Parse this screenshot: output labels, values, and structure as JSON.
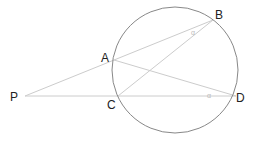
{
  "diagram": {
    "type": "geometry",
    "circle": {
      "cx": 175,
      "cy": 70,
      "r": 63,
      "stroke": "#888888"
    },
    "points": {
      "P": {
        "label": "P",
        "x": 25,
        "y": 96
      },
      "A": {
        "label": "A",
        "x": 114,
        "y": 60
      },
      "B": {
        "label": "B",
        "x": 213,
        "y": 20
      },
      "C": {
        "label": "C",
        "x": 118,
        "y": 96
      },
      "D": {
        "label": "D",
        "x": 236,
        "y": 96
      }
    },
    "segments": [
      {
        "from": "P",
        "to": "B"
      },
      {
        "from": "P",
        "to": "D"
      },
      {
        "from": "A",
        "to": "D"
      },
      {
        "from": "C",
        "to": "B"
      }
    ],
    "line_color": "#cccccc",
    "angle_marks": [
      {
        "label": "α",
        "at": "B",
        "x": 194,
        "y": 33
      },
      {
        "label": "α",
        "at": "D",
        "x": 210,
        "y": 94
      }
    ]
  }
}
